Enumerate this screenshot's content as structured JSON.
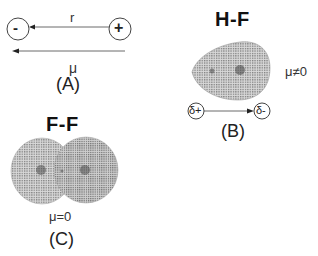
{
  "panel_a": {
    "negative_charge": "-",
    "positive_charge": "+",
    "distance_label": "r",
    "dipole_label": "μ",
    "caption": "(A)"
  },
  "panel_b": {
    "title": "H-F",
    "dipole_value": "μ≠0",
    "partial_positive": "δ+",
    "partial_negative": "δ-",
    "caption": "(B)"
  },
  "panel_c": {
    "title": "F-F",
    "dipole_value": "μ=0",
    "caption": "(C)"
  },
  "colors": {
    "line": "#333333",
    "cloud": "#8a8a8a"
  }
}
